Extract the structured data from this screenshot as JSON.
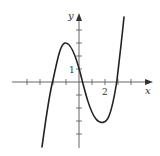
{
  "diagram": {
    "type": "function-graph",
    "x_axis_label": "x",
    "y_axis_label": "y",
    "tick_labels": {
      "x_tick_2": "2",
      "y_tick_1": "1"
    },
    "origin_px": [
      79,
      82
    ],
    "unit_px": 13,
    "x_ticks": [
      -4,
      -3,
      -2,
      -1,
      1,
      2,
      3,
      4
    ],
    "y_ticks": [
      -4,
      -3,
      -2,
      -1,
      1,
      2,
      3,
      4
    ],
    "curve_key_points": {
      "local_max": [
        -1.15,
        3
      ],
      "local_min": [
        1.85,
        -3
      ],
      "y_intercept": [
        0,
        1
      ],
      "roots_approx": [
        -2.1,
        0.3,
        2.9
      ]
    },
    "colors": {
      "axis": "#444444",
      "curve": "#222222",
      "background": "#ffffff"
    }
  }
}
